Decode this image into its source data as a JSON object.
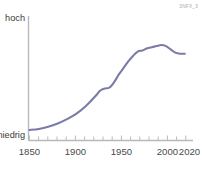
{
  "watermark": {
    "text": "3NFX_3"
  },
  "chart_data": {
    "type": "line",
    "title": "",
    "subtitle": "",
    "xlabel": "",
    "ylabel": "",
    "grid": false,
    "legend": null,
    "legend_position": "none",
    "line_color": "#7b7ba8",
    "axis_color": "#b9b9bd",
    "background": "#ffffff",
    "xlim": [
      1845,
      2022
    ],
    "ylim": [
      0,
      100
    ],
    "y_axis": {
      "type": "qualitative",
      "low_label": "niedrig",
      "high_label": "hoch",
      "ticks": []
    },
    "x_axis": {
      "tick_labels": [
        "1850",
        "1900",
        "1950",
        "2000",
        "2020"
      ],
      "tick_label_values": [
        1850,
        1900,
        1950,
        2000,
        2020
      ],
      "minor_tick_interval": 10,
      "minor_ticks": [
        1850,
        1860,
        1870,
        1880,
        1890,
        1900,
        1910,
        1920,
        1930,
        1940,
        1950,
        1960,
        1970,
        1980,
        1990,
        2000,
        2010,
        2020
      ]
    },
    "series": [
      {
        "name": "trend",
        "color": "#7b7ba8",
        "x": [
          1850,
          1860,
          1870,
          1880,
          1890,
          1900,
          1910,
          1920,
          1925,
          1930,
          1935,
          1940,
          1945,
          1950,
          1955,
          1960,
          1965,
          1970,
          1975,
          1980,
          1985,
          1990,
          1995,
          2000,
          2005,
          2010,
          2015
        ],
        "values": [
          9,
          10,
          12,
          15,
          19,
          24,
          31,
          40,
          45,
          47,
          48,
          53,
          60,
          66,
          72,
          77,
          81,
          82,
          84,
          85,
          86,
          87,
          86,
          83,
          80,
          79,
          79
        ]
      }
    ],
    "annotations": [
      {
        "label": "shoulder",
        "x": 1930,
        "y": 47
      },
      {
        "label": "peak",
        "x": 1990,
        "y": 87
      },
      {
        "label": "slight-decline-end",
        "x": 2015,
        "y": 79
      }
    ]
  }
}
